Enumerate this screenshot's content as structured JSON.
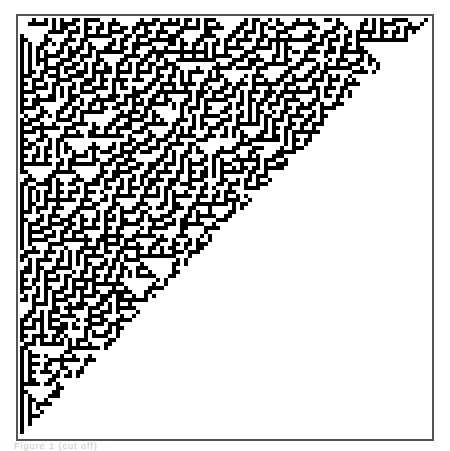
{
  "figure": {
    "type": "cellular-automaton-triangle",
    "cell_size_px": 4,
    "columns": 102,
    "rows": 104,
    "fill_color": "#000000",
    "background_color": "#ffffff",
    "frame_color": "#555555",
    "region": "upper-left triangle bounded by diagonal from top-right to bottom-left",
    "density": 0.42
  },
  "caption": {
    "text": "Figure 1 (cut off)"
  }
}
